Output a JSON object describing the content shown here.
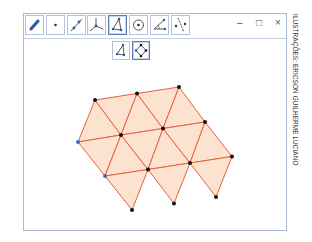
{
  "window": {
    "controls": {
      "minimize": "–",
      "maximize": "□",
      "close": "×"
    }
  },
  "toolbar": {
    "tools": [
      {
        "name": "move-tool",
        "icon": "pointer-arrow-icon",
        "selected": false
      },
      {
        "name": "point-tool",
        "icon": "point-icon",
        "selected": false
      },
      {
        "name": "line-tool",
        "icon": "line-through-two-points-icon",
        "selected": false
      },
      {
        "name": "perpendicular-tool",
        "icon": "perpendicular-lines-icon",
        "selected": false
      },
      {
        "name": "polygon-tool",
        "icon": "polygon-icon",
        "selected": true
      },
      {
        "name": "circle-tool",
        "icon": "circle-with-center-icon",
        "selected": false
      },
      {
        "name": "angle-tool",
        "icon": "angle-icon",
        "selected": false
      },
      {
        "name": "reflect-tool",
        "icon": "reflect-about-line-icon",
        "selected": false
      }
    ],
    "subtools": [
      {
        "name": "polygon-subtool",
        "icon": "polygon-icon",
        "selected": false
      },
      {
        "name": "regular-polygon-subtool",
        "icon": "regular-polygon-icon",
        "selected": true
      }
    ]
  },
  "drawing": {
    "fill_color": "#fce3cf",
    "stroke_color": "#e8603c",
    "point_color": "#111111",
    "highlight_point_color": "#3a6fb5",
    "rows": [
      [
        [
          95,
          100
        ],
        [
          137,
          93.5
        ],
        [
          179,
          87
        ]
      ],
      [
        [
          78,
          142
        ],
        [
          121,
          135
        ],
        [
          163,
          128.5
        ],
        [
          205,
          122
        ]
      ],
      [
        [
          105,
          176
        ],
        [
          148,
          169.5
        ],
        [
          190,
          163
        ],
        [
          232,
          156.5
        ]
      ],
      [
        [
          132,
          210
        ],
        [
          174,
          203.5
        ],
        [
          216,
          197
        ]
      ]
    ],
    "blue_points": [
      [
        78,
        142
      ],
      [
        105,
        176
      ]
    ]
  },
  "credit": "ILUSTRAÇÕES: ERICSON GUILHERME LUCIANO"
}
